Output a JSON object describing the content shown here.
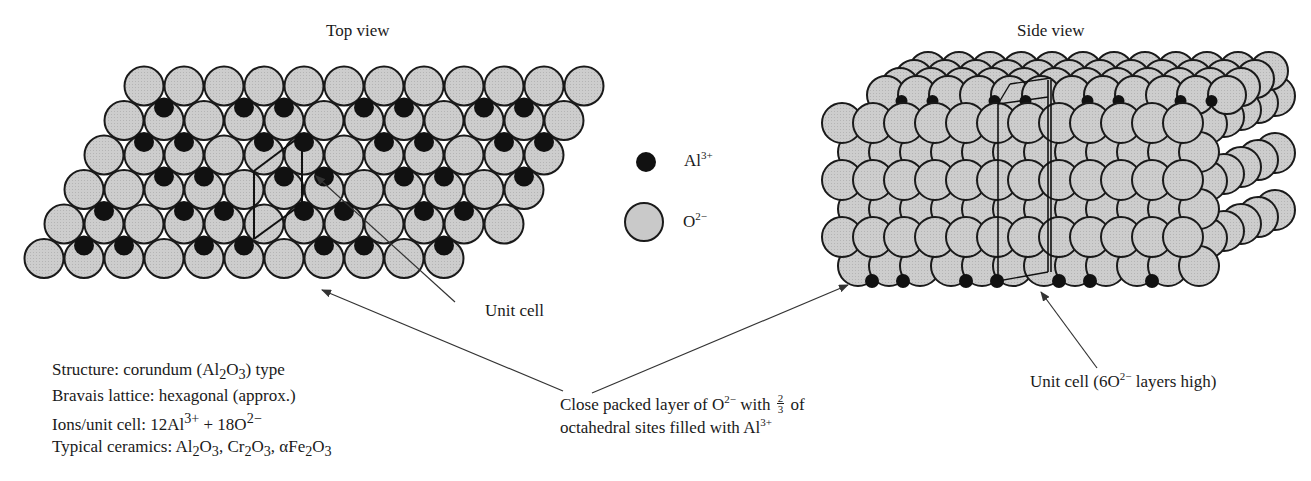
{
  "figure": {
    "top_view_title": "Top view",
    "side_view_title": "Side view",
    "legend": [
      {
        "symbol": "filled-black-small-circle",
        "ion": "Al",
        "charge": "3+",
        "color": "#111111"
      },
      {
        "symbol": "gray-large-circle",
        "ion": "O",
        "charge": "2−",
        "color": "#c9c9c9"
      }
    ],
    "annotations": {
      "unit_cell_top": "Unit cell",
      "close_packed": {
        "line1_prefix": "Close packed layer of O",
        "line1_charge": "2−",
        "line1_mid": " with ",
        "fraction_num": "2",
        "fraction_den": "3",
        "line1_suffix": " of",
        "line2_prefix": "octahedral sites filled with Al",
        "line2_charge": "3+"
      },
      "unit_cell_side": {
        "prefix": "Unit cell (6O",
        "charge": "2−",
        "suffix": " layers high)"
      }
    },
    "properties": {
      "structure": {
        "prefix": "Structure: corundum (Al",
        "sub1": "2",
        "mid": "O",
        "sub2": "3",
        "suffix": ") type"
      },
      "bravais": "Bravais lattice: hexagonal (approx.)",
      "ions": {
        "prefix": "Ions/unit cell: 12Al",
        "sup1": "3+",
        "mid": " + 18O",
        "sup2": "2−"
      },
      "ceramics": {
        "prefix": "Typical ceramics: ",
        "items": [
          {
            "pre": "",
            "el1": "Al",
            "n1": "2",
            "el2": "O",
            "n2": "3"
          },
          {
            "pre": ", ",
            "el1": "Cr",
            "n1": "2",
            "el2": "O",
            "n2": "3"
          },
          {
            "pre": ", α",
            "el1": "Fe",
            "n1": "2",
            "el2": "O",
            "n2": "3"
          }
        ]
      }
    },
    "colors": {
      "oxygen_fill": "#c9c9c9",
      "aluminum_fill": "#111111",
      "outline": "#1a1a1a",
      "arrow": "#333333"
    },
    "top_view_lattice": {
      "rows": 6,
      "circles_per_row": 12,
      "radius": 19.5,
      "pitch": 40,
      "row_step": 34.5,
      "first_row_x": 144,
      "first_row_y": 86,
      "row_shift": -20
    },
    "side_view_lattice": {
      "layers": 3,
      "circles_per_layer": 12,
      "radius": 20
    }
  }
}
